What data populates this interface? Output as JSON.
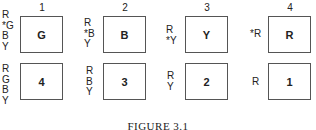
{
  "figure": {
    "caption": "FIGURE 3.1",
    "columns": [
      {
        "number": "1",
        "top": {
          "box_label": "G",
          "side_labels": [
            "R",
            "*G",
            "B",
            "Y"
          ]
        },
        "bottom": {
          "box_label": "4",
          "side_labels": [
            "R",
            "G",
            "B",
            "Y"
          ]
        }
      },
      {
        "number": "2",
        "top": {
          "box_label": "B",
          "side_labels": [
            "R",
            "*B",
            "Y"
          ]
        },
        "bottom": {
          "box_label": "3",
          "side_labels": [
            "R",
            "B",
            "Y"
          ]
        }
      },
      {
        "number": "3",
        "top": {
          "box_label": "Y",
          "side_labels": [
            "R",
            "*Y"
          ]
        },
        "bottom": {
          "box_label": "2",
          "side_labels": [
            "R",
            "Y"
          ]
        }
      },
      {
        "number": "4",
        "top": {
          "box_label": "R",
          "side_labels": [
            "*R"
          ]
        },
        "bottom": {
          "box_label": "1",
          "side_labels": [
            "R"
          ]
        }
      }
    ]
  }
}
